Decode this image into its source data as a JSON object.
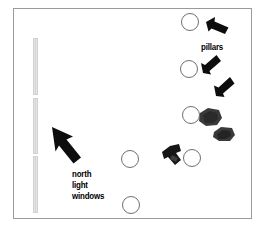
{
  "diagram": {
    "background_color": "#ffffff",
    "border_color": "#9a9a9a",
    "ink_color": "#000000",
    "window_color": "#cfcfcf",
    "pillar_stroke": "#6f6f6f",
    "labels": {
      "pillars": "pillars",
      "north": "north",
      "light": "light",
      "windows": "windows"
    },
    "pillars": [
      {
        "name": "pillar-top-right",
        "cx": 190,
        "cy": 22,
        "r": 9
      },
      {
        "name": "pillar-mid-right",
        "cx": 189,
        "cy": 69,
        "r": 9
      },
      {
        "name": "pillar-lower-right",
        "cx": 191,
        "cy": 115,
        "r": 9
      },
      {
        "name": "pillar-center",
        "cx": 130,
        "cy": 159,
        "r": 9
      },
      {
        "name": "pillar-right-low",
        "cx": 192,
        "cy": 158,
        "r": 9
      },
      {
        "name": "pillar-bottom",
        "cx": 131,
        "cy": 205,
        "r": 9
      }
    ],
    "windows": [
      {
        "name": "window-upper",
        "x": 33,
        "y": 38,
        "height": 57
      },
      {
        "name": "window-middle",
        "x": 33,
        "y": 98,
        "height": 56
      },
      {
        "name": "window-lower",
        "x": 33,
        "y": 156,
        "height": 57
      }
    ],
    "arrows": [
      {
        "name": "arrow-pillar-top",
        "points": "225,18 208,25 212,29 227,33 231,25"
      },
      {
        "name": "arrow-pillar-middle",
        "points": "204,72 221,63 217,59 203,55 200,64"
      },
      {
        "name": "arrow-pillar-lower",
        "points": "219,93 232,79 228,76 218,73 214,82"
      },
      {
        "name": "arrow-north-light",
        "points": "54,133 78,155 72,161 60,151 57,140"
      }
    ],
    "objects": [
      {
        "name": "dark-blob-upper",
        "cx": 211,
        "cy": 118
      },
      {
        "name": "dark-blob-lower",
        "cx": 224,
        "cy": 134
      },
      {
        "name": "dark-angular-object",
        "cx": 174,
        "cy": 157
      }
    ]
  }
}
